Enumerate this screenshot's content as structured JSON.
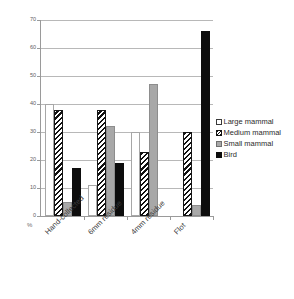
{
  "chart_data": {
    "type": "bar",
    "title": "",
    "xlabel": "",
    "ylabel": "%",
    "ylim": [
      0,
      70
    ],
    "yticks": [
      0,
      10,
      20,
      30,
      40,
      50,
      60,
      70
    ],
    "ytick_labels": [
      "0",
      "10",
      "20",
      "30",
      "40",
      "50",
      "60",
      "70"
    ],
    "grid": true,
    "legend_position": "right",
    "categories": [
      "Hand-collected",
      "6mm residue",
      "4mm residue",
      "Flot"
    ],
    "series": [
      {
        "name": "Large mammal",
        "key": "large",
        "pattern": "open",
        "color": "#ffffff",
        "values": [
          40,
          11,
          30,
          0
        ]
      },
      {
        "name": "Medium mammal",
        "key": "medium",
        "pattern": "hatched",
        "color": "#111111",
        "values": [
          38,
          38,
          23,
          30
        ]
      },
      {
        "name": "Small mammal",
        "key": "small",
        "pattern": "solid",
        "color": "#a8a8a8",
        "values": [
          5,
          32,
          47,
          4
        ]
      },
      {
        "name": "Bird",
        "key": "bird",
        "pattern": "solid",
        "color": "#0d0d0d",
        "values": [
          17,
          19,
          0,
          66
        ]
      }
    ]
  }
}
